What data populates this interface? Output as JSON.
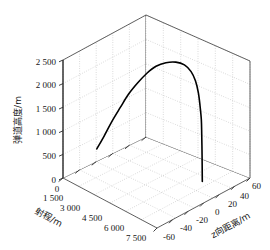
{
  "figure": {
    "background_color": "#ffffff",
    "curve_color": "#000000",
    "grid_color": "#8d8d8d",
    "frame_color": "#3c3c3c",
    "caption_partial": ""
  },
  "chart_data": {
    "type": "line",
    "projection": "3d",
    "title": "",
    "subtitle": "",
    "xlabel": "射程/m",
    "ylabel": "弹道高度/m",
    "zlabel": "z向距离/m",
    "xlim": [
      0,
      7500
    ],
    "ylim": [
      0,
      2750
    ],
    "zlim": [
      -60,
      60
    ],
    "x_ticks": [
      0,
      1500,
      3000,
      4500,
      6000,
      7500
    ],
    "x_tick_labels": [
      "0",
      "1 500",
      "3 000",
      "4 500",
      "6 000",
      "7 500"
    ],
    "y_ticks": [
      0,
      500,
      1000,
      1500,
      2000,
      2500
    ],
    "y_tick_labels": [
      "0",
      "500",
      "1 000",
      "1 500",
      "2 000",
      "2 500"
    ],
    "z_ticks": [
      -60,
      -40,
      -20,
      0,
      20,
      40,
      60
    ],
    "z_tick_labels": [
      "-60",
      "-40",
      "-20",
      "0",
      "20",
      "40",
      "60"
    ],
    "grid": true,
    "grid_style": "dotted",
    "legend": false,
    "legend_position": "none",
    "series": [
      {
        "name": "弹道轨迹",
        "color": "#000000",
        "line_width": 1.6,
        "points": [
          {
            "x": 1500,
            "y": 700,
            "z": -38
          },
          {
            "x": 1900,
            "y": 1000,
            "z": -34
          },
          {
            "x": 2300,
            "y": 1320,
            "z": -30
          },
          {
            "x": 2700,
            "y": 1640,
            "z": -25
          },
          {
            "x": 3100,
            "y": 1950,
            "z": -20
          },
          {
            "x": 3500,
            "y": 2220,
            "z": -14
          },
          {
            "x": 3900,
            "y": 2450,
            "z": -8
          },
          {
            "x": 4300,
            "y": 2620,
            "z": -2
          },
          {
            "x": 4700,
            "y": 2720,
            "z": 5
          },
          {
            "x": 5100,
            "y": 2750,
            "z": 12
          },
          {
            "x": 5450,
            "y": 2700,
            "z": 18
          },
          {
            "x": 5700,
            "y": 2560,
            "z": 23
          },
          {
            "x": 5880,
            "y": 2350,
            "z": 26
          },
          {
            "x": 6000,
            "y": 2080,
            "z": 28
          },
          {
            "x": 6080,
            "y": 1780,
            "z": 29
          },
          {
            "x": 6130,
            "y": 1450,
            "z": 30
          },
          {
            "x": 6165,
            "y": 1100,
            "z": 30
          },
          {
            "x": 6190,
            "y": 740,
            "z": 30
          },
          {
            "x": 6205,
            "y": 380,
            "z": 30
          },
          {
            "x": 6215,
            "y": 60,
            "z": 30
          },
          {
            "x": 6220,
            "y": 0,
            "z": 30
          }
        ]
      }
    ],
    "annotations": []
  }
}
